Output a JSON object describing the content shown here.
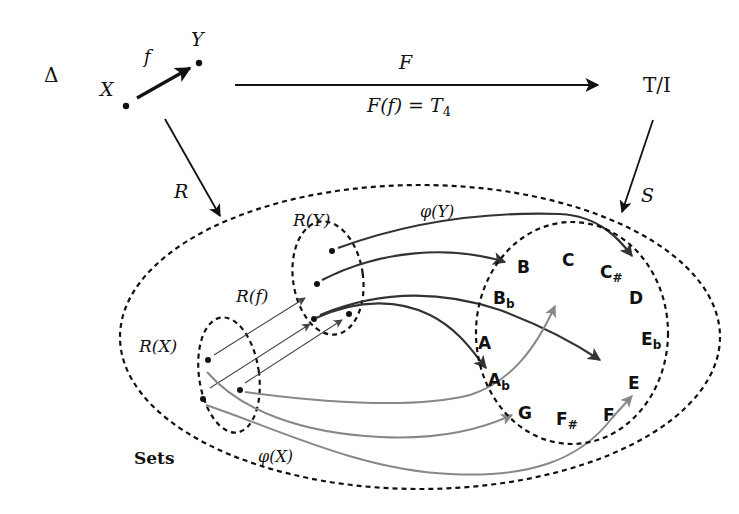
{
  "diagram": {
    "top_row": {
      "delta_label": "Δ",
      "x_label": "X",
      "y_label": "Y",
      "f_label": "f",
      "functor_label": "F",
      "functor_eq_lhs": "F(f) = T",
      "functor_eq_sub": "4",
      "target_label": "T/I"
    },
    "vertical_arrows": {
      "left_label": "R",
      "right_label": "S"
    },
    "sets_region": {
      "label": "Sets",
      "rx_label": "R(X)",
      "ry_label": "R(Y)",
      "rf_label": "R(f)",
      "phi_y_label": "φ(Y)",
      "phi_x_label": "φ(X)"
    },
    "notes": {
      "C": "C",
      "Cs_base": "C",
      "Cs_acc": "#",
      "D": "D",
      "Eb_base": "E",
      "Eb_acc": "b",
      "E": "E",
      "F": "F",
      "Fs_base": "F",
      "Fs_acc": "#",
      "G": "G",
      "Ab_base": "A",
      "Ab_acc": "b",
      "A": "A",
      "Bb_base": "B",
      "Bb_acc": "b",
      "B": "B"
    },
    "colors": {
      "phi_y_arrows": "#333333",
      "phi_x_arrows": "#888888",
      "phi_x_label": "#999999",
      "background": "#ffffff"
    }
  }
}
